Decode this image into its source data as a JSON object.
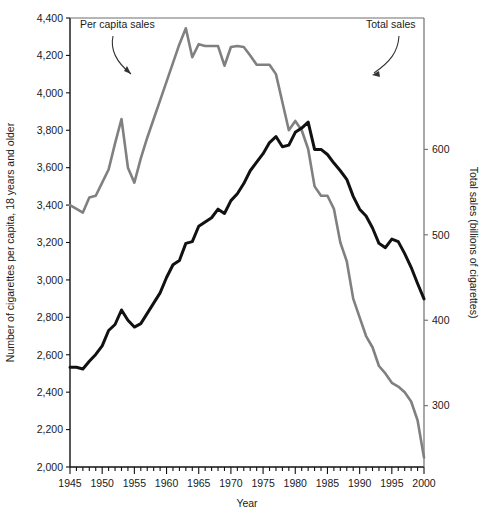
{
  "chart_data": {
    "type": "line",
    "title": "",
    "xlabel": "Year",
    "ylabel": "Number of cigarettes per capita, 18 years and older",
    "y2label": "Total sales (billions of cigarettes)",
    "xlim": [
      1945,
      2000
    ],
    "ylim": [
      2000,
      4400
    ],
    "y2lim": [
      228.2,
      753.8
    ],
    "grid": false,
    "legend_position": "inline-annotations",
    "xticks": [
      1945,
      1950,
      1955,
      1960,
      1965,
      1970,
      1975,
      1980,
      1985,
      1990,
      1995,
      2000
    ],
    "xtick_labels": [
      "1945",
      "1950",
      "1955",
      "1960",
      "1965",
      "1970",
      "1975",
      "1980",
      "1985",
      "1990",
      "1995",
      "2000"
    ],
    "xminor_step": 1,
    "yticks": [
      2000,
      2200,
      2400,
      2600,
      2800,
      3000,
      3200,
      3400,
      3600,
      3800,
      4000,
      4200,
      4400
    ],
    "ytick_labels": [
      "2,000",
      "2,200",
      "2,400",
      "2,600",
      "2,800",
      "3,000",
      "3,200",
      "3,400",
      "3,600",
      "3,800",
      "4,000",
      "4,200",
      "4,400"
    ],
    "y2ticks": [
      300,
      400,
      500,
      600
    ],
    "y2tick_labels": [
      "300",
      "400",
      "500",
      "600"
    ],
    "annotations": [
      {
        "text": "Per capita sales",
        "target": "per-capita-series"
      },
      {
        "text": "Total sales",
        "target": "total-series"
      }
    ],
    "series": [
      {
        "name": "Per capita sales",
        "color": "#808080",
        "axis": "left",
        "units": "cigarettes per capita, 18+",
        "x": [
          1945,
          1946,
          1947,
          1948,
          1949,
          1950,
          1951,
          1952,
          1953,
          1954,
          1955,
          1956,
          1957,
          1958,
          1959,
          1960,
          1961,
          1962,
          1963,
          1964,
          1965,
          1966,
          1967,
          1968,
          1969,
          1970,
          1971,
          1972,
          1973,
          1974,
          1975,
          1976,
          1977,
          1978,
          1979,
          1980,
          1981,
          1982,
          1983,
          1984,
          1985,
          1986,
          1987,
          1988,
          1989,
          1990,
          1991,
          1992,
          1993,
          1994,
          1995,
          1996,
          1997,
          1998,
          1999,
          2000
        ],
        "values": [
          3400,
          3380,
          3360,
          3440,
          3450,
          3520,
          3590,
          3730,
          3860,
          3600,
          3520,
          3650,
          3760,
          3860,
          3960,
          4060,
          4160,
          4260,
          4345,
          4190,
          4260,
          4250,
          4250,
          4250,
          4145,
          4245,
          4250,
          4245,
          4200,
          4150,
          4150,
          4150,
          4100,
          3950,
          3800,
          3850,
          3800,
          3700,
          3500,
          3450,
          3450,
          3380,
          3200,
          3100,
          2900,
          2800,
          2700,
          2640,
          2540,
          2500,
          2450,
          2430,
          2400,
          2350,
          2250,
          2050
        ]
      },
      {
        "name": "Total sales",
        "color": "#111111",
        "axis": "right",
        "units": "billions of cigarettes",
        "x": [
          1945,
          1946,
          1947,
          1948,
          1949,
          1950,
          1951,
          1952,
          1953,
          1954,
          1955,
          1956,
          1957,
          1958,
          1959,
          1960,
          1961,
          1962,
          1963,
          1964,
          1965,
          1966,
          1967,
          1968,
          1969,
          1970,
          1971,
          1972,
          1973,
          1974,
          1975,
          1976,
          1977,
          1978,
          1979,
          1980,
          1981,
          1982,
          1983,
          1984,
          1985,
          1986,
          1987,
          1988,
          1989,
          1990,
          1991,
          1992,
          1993,
          1994,
          1995,
          1996,
          1997,
          1998,
          1999,
          2000
        ],
        "values": [
          345,
          345,
          343,
          352,
          360,
          370,
          388,
          395,
          412,
          400,
          392,
          396,
          408,
          420,
          432,
          450,
          465,
          470,
          490,
          492,
          510,
          515,
          520,
          530,
          525,
          540,
          548,
          560,
          575,
          585,
          595,
          608,
          615,
          603,
          605,
          620,
          625,
          632,
          600,
          600,
          594,
          584,
          575,
          565,
          545,
          530,
          522,
          508,
          490,
          485,
          495,
          492,
          478,
          462,
          443,
          425
        ]
      }
    ]
  },
  "plot_geometry": {
    "left_px": 70,
    "right_px": 424,
    "top_px": 18,
    "bottom_px": 467
  }
}
